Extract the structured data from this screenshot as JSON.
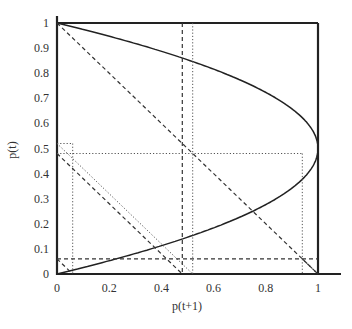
{
  "chart_data": {
    "type": "line",
    "title": "",
    "xlabel": "p(t+1)",
    "ylabel": "p(t)",
    "xlim": [
      0,
      1
    ],
    "ylim": [
      0,
      1
    ],
    "grid": false,
    "legend": "none",
    "x_ticks": [
      "0",
      "0.2",
      "0.4",
      "0.6",
      "0.8",
      "1"
    ],
    "y_ticks": [
      "0",
      "0.1",
      "0.2",
      "0.3",
      "0.4",
      "0.5",
      "0.6",
      "0.7",
      "0.8",
      "0.9",
      "1"
    ],
    "series": [
      {
        "name": "logistic curve p(t) vs p(t+1)",
        "style": "solid",
        "description": "parabola p(t+1)=4p(t)(1-p(t)) drawn with p(t+1) on x-axis; spans x 0..1, peak y=1 at x=0.5",
        "points": [
          [
            0,
            0
          ],
          [
            0.0975,
            0.0253
          ],
          [
            0.19,
            0.0505
          ],
          [
            0.36,
            0.1
          ],
          [
            0.51,
            0.15
          ],
          [
            0.64,
            0.2
          ],
          [
            0.75,
            0.25
          ],
          [
            0.84,
            0.3
          ],
          [
            0.91,
            0.35
          ],
          [
            0.96,
            0.4
          ],
          [
            0.99,
            0.45
          ],
          [
            1,
            0.5
          ],
          [
            0.99,
            0.55
          ],
          [
            0.96,
            0.6
          ],
          [
            0.91,
            0.65
          ],
          [
            0.84,
            0.7
          ],
          [
            0.75,
            0.75
          ],
          [
            0.64,
            0.8
          ],
          [
            0.51,
            0.85
          ],
          [
            0.36,
            0.9
          ],
          [
            0.19,
            0.95
          ],
          [
            0,
            1
          ]
        ]
      },
      {
        "name": "frame top",
        "style": "solid",
        "points": [
          [
            0,
            1
          ],
          [
            1,
            1
          ]
        ]
      },
      {
        "name": "frame right",
        "style": "solid",
        "points": [
          [
            1,
            1
          ],
          [
            1,
            0
          ]
        ]
      },
      {
        "name": "diagonal 1",
        "style": "dashed",
        "points": [
          [
            0,
            1
          ],
          [
            1,
            0
          ]
        ]
      },
      {
        "name": "diagonal 0.48",
        "style": "dashed",
        "points": [
          [
            0,
            0.48
          ],
          [
            0.48,
            0
          ]
        ]
      },
      {
        "name": "diagonal 0.52",
        "style": "dotted",
        "points": [
          [
            0,
            0.52
          ],
          [
            0.52,
            0
          ]
        ]
      },
      {
        "name": "diagonal 0.06 left",
        "style": "dashed",
        "points": [
          [
            0,
            0.06
          ],
          [
            0.06,
            0
          ]
        ]
      },
      {
        "name": "diagonal 0.06 right",
        "style": "dashed",
        "points": [
          [
            0.94,
            0.06
          ],
          [
            1,
            0
          ]
        ]
      },
      {
        "name": "horizontal 0.06",
        "style": "dashed",
        "points": [
          [
            0,
            0.06
          ],
          [
            1,
            0.06
          ]
        ]
      },
      {
        "name": "vertical 0.48",
        "style": "dashed",
        "points": [
          [
            0.48,
            1
          ],
          [
            0.48,
            0
          ]
        ]
      },
      {
        "name": "vertical 0.52",
        "style": "dotted",
        "points": [
          [
            0.52,
            1
          ],
          [
            0.52,
            0
          ]
        ]
      },
      {
        "name": "horizontal 0.48",
        "style": "dotted",
        "points": [
          [
            0,
            0.48
          ],
          [
            0.94,
            0.48
          ]
        ]
      },
      {
        "name": "horizontal 0.52",
        "style": "dotted",
        "points": [
          [
            0,
            0.52
          ],
          [
            0.06,
            0.52
          ]
        ]
      },
      {
        "name": "vertical 0.06",
        "style": "dotted",
        "points": [
          [
            0.06,
            0.52
          ],
          [
            0.06,
            0
          ]
        ]
      },
      {
        "name": "vertical 0.94",
        "style": "dotted",
        "points": [
          [
            0.94,
            0.48
          ],
          [
            0.94,
            0
          ]
        ]
      }
    ]
  }
}
